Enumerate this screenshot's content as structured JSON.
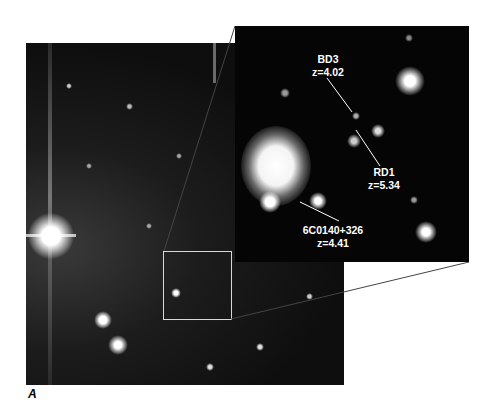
{
  "figure": {
    "panel_label": "A",
    "inset_labels": [
      {
        "name": "BD3",
        "redshift": "z=4.02"
      },
      {
        "name": "RD1",
        "redshift": "z=5.34"
      },
      {
        "name": "6C0140+326",
        "redshift": "z=4.41"
      }
    ]
  },
  "colors": {
    "background": "#ffffff",
    "sky": "#0b0b0b",
    "label_text": "#ffffff",
    "zoom_box": "#d8d8d8"
  }
}
